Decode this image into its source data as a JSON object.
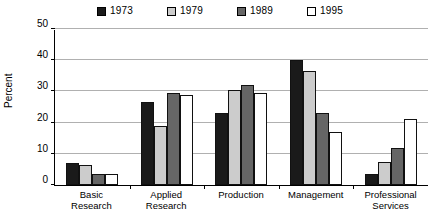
{
  "chart_data": {
    "type": "bar",
    "title": "",
    "xlabel": "",
    "ylabel": "Percent",
    "ylim": [
      0,
      50
    ],
    "yticks": [
      0,
      10,
      20,
      30,
      40,
      50
    ],
    "grid": true,
    "legend_position": "top-center",
    "categories": [
      "Basic\nResearch",
      "Applied\nResearch",
      "Production",
      "Management",
      "Professional\nServices"
    ],
    "category_labels": [
      {
        "line1": "Basic",
        "line2": "Research"
      },
      {
        "line1": "Applied",
        "line2": "Research"
      },
      {
        "line1": "Production",
        "line2": ""
      },
      {
        "line1": "Management",
        "line2": ""
      },
      {
        "line1": "Professional",
        "line2": "Services"
      }
    ],
    "series": [
      {
        "name": "1973",
        "color": "#1a1a1a",
        "values": [
          7,
          26.5,
          23,
          40,
          3.5
        ]
      },
      {
        "name": "1979",
        "color": "#cccccc",
        "values": [
          6.5,
          19,
          30.5,
          36.5,
          7.5
        ]
      },
      {
        "name": "1989",
        "color": "#666666",
        "values": [
          3.5,
          29.5,
          32,
          23,
          12
        ]
      },
      {
        "name": "1995",
        "color": "#ffffff",
        "values": [
          3.5,
          29,
          29.5,
          17,
          21
        ]
      }
    ]
  },
  "axis": {
    "y_label": "Percent",
    "y_tick_labels": [
      "0",
      "10",
      "20",
      "30",
      "40",
      "50"
    ]
  },
  "legend": {
    "entries": [
      {
        "label": "1973",
        "color": "#1a1a1a"
      },
      {
        "label": "1979",
        "color": "#cccccc"
      },
      {
        "label": "1989",
        "color": "#666666"
      },
      {
        "label": "1995",
        "color": "#ffffff"
      }
    ]
  }
}
